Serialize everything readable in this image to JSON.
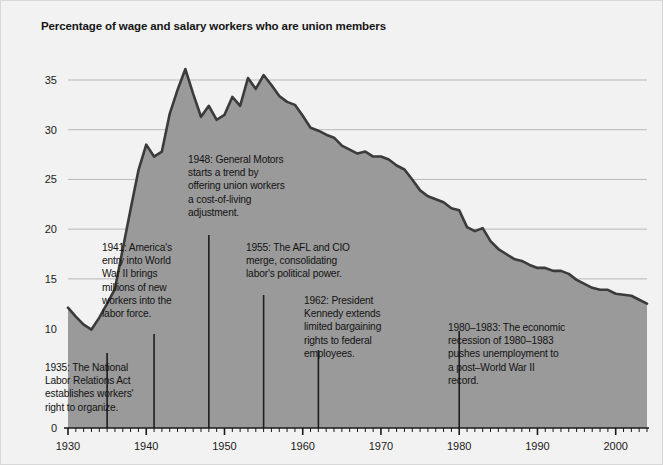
{
  "figure": {
    "title": "Percentage of wage and salary workers who are union members",
    "background_color": "#f2f2f2",
    "area_fill_color": "#9a9a9a",
    "line_color": "#3b3b3b",
    "gridline_color": "#b8b8b8",
    "text_color": "#131313"
  },
  "chart_data": {
    "type": "area",
    "title": "Percentage of wage and salary workers who are union members",
    "xlabel": "",
    "ylabel": "",
    "xlim": [
      1930,
      2004
    ],
    "ylim": [
      0,
      38
    ],
    "grid": true,
    "legend": "none",
    "y_ticks": [
      0,
      10,
      15,
      20,
      25,
      30,
      35
    ],
    "y_tick_labels": [
      "0",
      "10",
      "15",
      "20",
      "25",
      "30",
      "35"
    ],
    "x_ticks": [
      1930,
      1940,
      1950,
      1960,
      1970,
      1980,
      1990,
      2000
    ],
    "x_tick_labels": [
      "1930",
      "1940",
      "1950",
      "1960",
      "1970",
      "1980",
      "1990",
      "2000"
    ],
    "x_minor_tick_interval": 1,
    "x": [
      1930,
      1931,
      1932,
      1933,
      1934,
      1935,
      1936,
      1937,
      1938,
      1939,
      1940,
      1941,
      1942,
      1943,
      1944,
      1945,
      1946,
      1947,
      1948,
      1949,
      1950,
      1951,
      1952,
      1953,
      1954,
      1955,
      1956,
      1957,
      1958,
      1959,
      1960,
      1961,
      1962,
      1963,
      1964,
      1965,
      1966,
      1967,
      1968,
      1969,
      1970,
      1971,
      1972,
      1973,
      1974,
      1975,
      1976,
      1977,
      1978,
      1979,
      1980,
      1981,
      1982,
      1983,
      1984,
      1985,
      1986,
      1987,
      1988,
      1989,
      1990,
      1991,
      1992,
      1993,
      1994,
      1995,
      1996,
      1997,
      1998,
      1999,
      2000,
      2001,
      2002,
      2003,
      2004
    ],
    "values": [
      12.1,
      11.2,
      10.4,
      9.9,
      11.1,
      12.5,
      14.0,
      18.0,
      22.0,
      25.9,
      28.5,
      27.3,
      27.8,
      31.6,
      34.0,
      36.1,
      33.6,
      31.3,
      32.4,
      31.0,
      31.5,
      33.3,
      32.4,
      35.2,
      34.1,
      35.5,
      34.5,
      33.4,
      32.8,
      32.5,
      31.4,
      30.2,
      29.9,
      29.5,
      29.2,
      28.4,
      28.0,
      27.6,
      27.8,
      27.3,
      27.3,
      27.0,
      26.4,
      26.0,
      25.0,
      23.9,
      23.3,
      23.0,
      22.7,
      22.1,
      21.9,
      20.2,
      19.8,
      20.1,
      18.8,
      18.0,
      17.5,
      17.0,
      16.8,
      16.4,
      16.1,
      16.1,
      15.8,
      15.8,
      15.5,
      14.9,
      14.5,
      14.1,
      13.9,
      13.9,
      13.5,
      13.4,
      13.3,
      12.9,
      12.5
    ],
    "annotations": [
      {
        "id": "annotation-1935",
        "year": 1935,
        "label": "1935: The National\nLabor Relations Act\nestablishes workers'\nright to organize."
      },
      {
        "id": "annotation-1941",
        "year": 1941,
        "label": "1941: America's\nentry into World\nWar II brings\nmillions of new\nworkers into the\nlabor force."
      },
      {
        "id": "annotation-1948",
        "year": 1948,
        "label": "1948: General Motors\nstarts a trend by\noffering union workers\na cost-of-living\nadjustment."
      },
      {
        "id": "annotation-1955",
        "year": 1955,
        "label": "1955: The AFL and CIO\nmerge, consolidating\nlabor's political power."
      },
      {
        "id": "annotation-1962",
        "year": 1962,
        "label": "1962: President\nKennedy extends\nlimited bargaining\nrights to federal\nemployees."
      },
      {
        "id": "annotation-1980",
        "year": 1980,
        "label": "1980–1983: The economic\nrecession of 1980–1983\npushes unemployment to\na post–World War II\nrecord."
      }
    ]
  }
}
